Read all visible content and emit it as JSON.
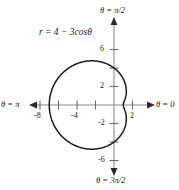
{
  "figure": {
    "equation_label": "r = 4 − 3cosθ",
    "axis_labels": {
      "right": "θ = 0",
      "top": "θ = π/2",
      "left": "θ = π",
      "bottom": "θ = 3π/2"
    },
    "colors": {
      "curve": "#1a1a1a",
      "axis": "#808080",
      "text": "#1a1a1a",
      "background": "#ffffff"
    }
  },
  "chart_data": {
    "type": "line",
    "title": "",
    "subtitle": "",
    "annotations": [
      "r = 4 − 3cosθ"
    ],
    "coordinate_system": "polar",
    "equation": "r = 4 - 3*cos(theta)",
    "curve_name": "limaçon with inner dimple",
    "xlabel": "θ = 0",
    "ylabel": "θ = π/2",
    "xlim": [
      -9.5,
      3.2
    ],
    "ylim": [
      -8.5,
      8.0
    ],
    "grid": false,
    "legend": "none",
    "x_ticks": [
      -8,
      -6,
      -4,
      -2,
      2
    ],
    "x_tick_labels": [
      "-8",
      "",
      "-4",
      "",
      "2"
    ],
    "y_ticks": [
      6,
      4,
      2,
      -2,
      -4,
      -6
    ],
    "y_tick_labels": [
      "6",
      "",
      "2",
      "-2",
      "",
      "-6"
    ],
    "key_points": [
      {
        "theta": 0,
        "r": 1,
        "x": 1,
        "y": 0,
        "note": "inner dimple at θ = 0"
      },
      {
        "theta": 1.5708,
        "r": 4,
        "x": 0,
        "y": 4,
        "note": "θ = π/2"
      },
      {
        "theta": 3.1416,
        "r": 7,
        "x": -7,
        "y": 0,
        "note": "maximum radius at θ = π"
      },
      {
        "theta": 4.7124,
        "r": 4,
        "x": 0,
        "y": -4,
        "note": "θ = 3π/2"
      }
    ],
    "theta": [
      0,
      0.2618,
      0.5236,
      0.7854,
      1.0472,
      1.309,
      1.5708,
      1.8326,
      2.0944,
      2.3562,
      2.618,
      2.8798,
      3.1416,
      3.4034,
      3.6652,
      3.927,
      4.1888,
      4.4506,
      4.7124,
      4.9742,
      5.236,
      5.4978,
      5.7596,
      6.0214,
      6.2832
    ],
    "r": [
      1.0,
      1.102,
      1.402,
      1.879,
      2.5,
      3.102,
      4.0,
      4.898,
      5.5,
      6.121,
      6.598,
      6.898,
      7.0,
      6.898,
      6.598,
      6.121,
      5.5,
      4.898,
      4.0,
      3.102,
      2.5,
      1.879,
      1.402,
      1.102,
      1.0
    ]
  }
}
